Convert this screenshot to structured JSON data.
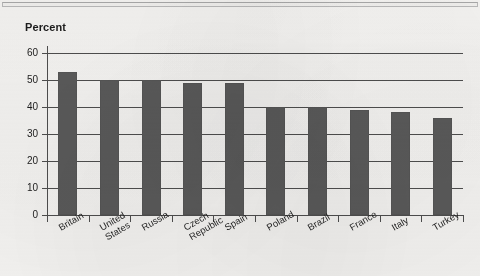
{
  "chart_data": {
    "type": "bar",
    "title": "Percent",
    "xlabel": "",
    "ylabel": "Percent",
    "ylim": [
      0,
      60
    ],
    "yticks": [
      0,
      10,
      20,
      30,
      40,
      50,
      60
    ],
    "grid": true,
    "legend": false,
    "bar_color": "#5a5a5a",
    "axis_color": "#4e4e4e",
    "background_color": "#f4f3f1",
    "categories": [
      "Britain",
      "United States",
      "Russia",
      "Czech Republic",
      "Spain",
      "Poland",
      "Brazil",
      "France",
      "Italy",
      "Turkey"
    ],
    "category_label_lines": [
      [
        "Britain"
      ],
      [
        "United",
        "States"
      ],
      [
        "Russia"
      ],
      [
        "Czech",
        "Republic"
      ],
      [
        "Spain"
      ],
      [
        "Poland"
      ],
      [
        "Brazil"
      ],
      [
        "France"
      ],
      [
        "Italy"
      ],
      [
        "Turkey"
      ]
    ],
    "values": [
      53,
      50,
      50,
      49,
      49,
      40,
      40,
      39,
      38,
      36
    ]
  }
}
